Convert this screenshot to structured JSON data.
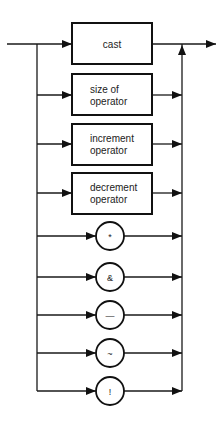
{
  "diagram": {
    "title": "",
    "type": "syntax-railroad",
    "entry": {
      "x1": 7,
      "x2": 72,
      "y": 44
    },
    "exit": {
      "x1": 152,
      "x2": 216,
      "y": 44
    },
    "left_rail_x": 37,
    "right_rail_x": 182,
    "rail_bottom_y": 391,
    "boxes": [
      {
        "id": "cast",
        "lines": [
          "cast"
        ],
        "x": 72,
        "y": 23,
        "w": 80,
        "h": 41,
        "cy": 44
      },
      {
        "id": "sizeof",
        "lines": [
          "size of",
          "operator"
        ],
        "x": 72,
        "y": 74,
        "w": 80,
        "h": 41,
        "cy": 95
      },
      {
        "id": "increment",
        "lines": [
          "increment",
          "operator"
        ],
        "x": 72,
        "y": 124,
        "w": 80,
        "h": 41,
        "cy": 144
      },
      {
        "id": "decrement",
        "lines": [
          "decrement",
          "operator"
        ],
        "x": 72,
        "y": 173,
        "w": 80,
        "h": 41,
        "cy": 193
      }
    ],
    "circles": [
      {
        "id": "star",
        "symbol": "*",
        "cx": 110,
        "cy": 236,
        "r": 14
      },
      {
        "id": "ampersand",
        "symbol": "&",
        "cx": 110,
        "cy": 277,
        "r": 14
      },
      {
        "id": "minus",
        "symbol": "—",
        "cx": 110,
        "cy": 315,
        "r": 14
      },
      {
        "id": "tilde",
        "symbol": "~",
        "cx": 110,
        "cy": 353,
        "r": 14
      },
      {
        "id": "not",
        "symbol": "!",
        "cx": 110,
        "cy": 391,
        "r": 14
      }
    ]
  }
}
